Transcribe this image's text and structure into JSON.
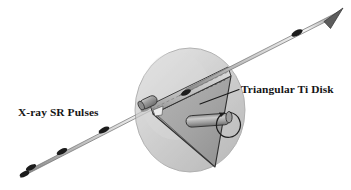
{
  "figure": {
    "type": "technical-illustration",
    "width": 351,
    "height": 190,
    "background_color": "#ffffff"
  },
  "labels": {
    "beam": {
      "text": "X-ray SR Pulses",
      "x": 18,
      "y": 116,
      "color": "#151515"
    },
    "disk": {
      "text": "Triangular Ti Disk",
      "x": 241,
      "y": 93,
      "color": "#151515"
    }
  },
  "beam": {
    "name": "x-ray-sr-beam",
    "direction": "lower-left to upper-right",
    "start": {
      "x": 24,
      "y": 174
    },
    "end": {
      "x": 336,
      "y": 14
    },
    "tube_color": "#d2d2d2",
    "tube_highlight": "#f2f2f2",
    "tube_edge": "#6b6b6b",
    "arrowhead_color": "#5a5a5a",
    "pulse_marker_color": "#1f1f1f",
    "pulse_count": 7
  },
  "sphere": {
    "name": "spherical-chamber",
    "center": {
      "x": 190,
      "y": 110
    },
    "radius_x": 56,
    "radius_y": 62,
    "fill_color": "#b9b9b9",
    "edge_color": "#8f8f8f",
    "opacity": 0.62
  },
  "triangular_disk": {
    "name": "triangular-ti-disk",
    "material": "Ti",
    "face_color": "#a8a8a8",
    "edge_color": "#2a2a2a",
    "top_edge_strip_color": "#c9c9c9",
    "vertices": [
      {
        "x": 152,
        "y": 113
      },
      {
        "x": 230,
        "y": 75
      },
      {
        "x": 214,
        "y": 166
      }
    ]
  },
  "shaft": {
    "name": "rotation-shaft",
    "color": "#9a9a9a",
    "highlight": "#c6c6c6",
    "edge_color": "#3a3a3a",
    "start": {
      "x": 186,
      "y": 122
    },
    "end": {
      "x": 228,
      "y": 118
    }
  },
  "rotation_arrow": {
    "name": "rotation-direction-arrow",
    "color": "#1f1f1f",
    "center": {
      "x": 228,
      "y": 124
    },
    "radius": 12
  },
  "mount": {
    "name": "disk-mount-cylinder",
    "color": "#9a9a9a",
    "edge_color": "#3a3a3a"
  },
  "leader_line": {
    "name": "disk-leader-line",
    "color": "#1f1f1f",
    "from": {
      "x": 239,
      "y": 89
    },
    "to": {
      "x": 200,
      "y": 104
    }
  },
  "colors": {
    "ink": "#151515",
    "metal_mid": "#9a9a9a",
    "metal_light": "#d2d2d2",
    "metal_dark": "#5a5a5a",
    "chamber": "#b9b9b9"
  }
}
